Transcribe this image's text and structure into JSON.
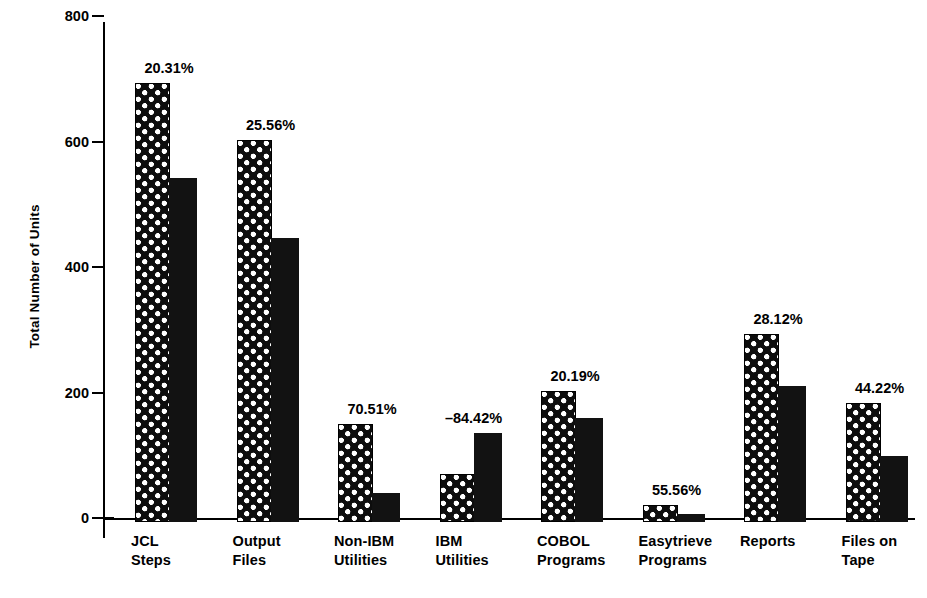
{
  "chart_data": {
    "type": "bar",
    "title": "",
    "xlabel": "",
    "ylabel": "Total Number of Units",
    "ylim": [
      0,
      800
    ],
    "yticks": [
      0,
      200,
      400,
      600,
      800
    ],
    "ytick_labels": [
      "0",
      "200",
      "400",
      "600",
      "800"
    ],
    "grid": false,
    "legend": "none",
    "categories": [
      "JCL Steps",
      "Output Files",
      "Non-IBM Utilities",
      "IBM Utilities",
      "COBOL Programs",
      "Easytrieve Programs",
      "Reports",
      "Files on Tape"
    ],
    "category_lines": [
      [
        "JCL",
        "Steps"
      ],
      [
        "Output",
        "Files"
      ],
      [
        "Non-IBM",
        "Utilities"
      ],
      [
        "IBM",
        "Utilities"
      ],
      [
        "COBOL",
        "Programs"
      ],
      [
        "Easytrieve",
        "Programs"
      ],
      [
        "Reports",
        ""
      ],
      [
        "Files on",
        "Tape"
      ]
    ],
    "series": [
      {
        "name": "Before",
        "pattern": "cross-hatch-dots",
        "values": [
          700,
          608,
          156,
          77,
          208,
          27,
          300,
          190
        ]
      },
      {
        "name": "After",
        "pattern": "solid-black",
        "values": [
          548,
          452,
          46,
          142,
          166,
          12,
          216,
          106
        ]
      }
    ],
    "annotations": [
      "20.31%",
      "25.56%",
      "70.51%",
      "–84.42%",
      "20.19%",
      "55.56%",
      "28.12%",
      "44.22%"
    ],
    "annotation_meaning": "percent change per category"
  },
  "colors": {
    "ink": "#000000",
    "background": "#ffffff",
    "bar_solid": "#121212",
    "bar_hatch_fill": "#0d0d0d",
    "bar_hatch_dots": "#ffffff"
  }
}
